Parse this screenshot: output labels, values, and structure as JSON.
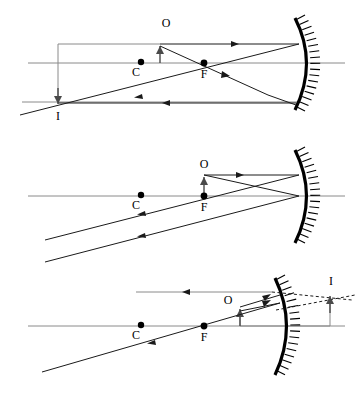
{
  "figure": {
    "background_color": "#ffffff",
    "mirror_color": "#000000",
    "ray_color": "#1a1a1a",
    "axis_color": "#8a8a8a",
    "panels": [
      {
        "id": "panel-1",
        "case": "object beyond C",
        "labels": {
          "object": "O",
          "image": "I",
          "center": "C",
          "focus": "F"
        },
        "image_type": "real inverted enlarged",
        "object_orientation": "up",
        "image_orientation": "down"
      },
      {
        "id": "panel-2",
        "case": "object at F",
        "labels": {
          "object": "O",
          "center": "C",
          "focus": "F"
        },
        "image_type": "no image, reflected rays parallel",
        "object_orientation": "up"
      },
      {
        "id": "panel-3",
        "case": "object between F and mirror",
        "labels": {
          "object": "O",
          "image": "I",
          "center": "C",
          "focus": "F"
        },
        "image_type": "virtual upright enlarged",
        "object_orientation": "up",
        "image_orientation": "up"
      }
    ]
  }
}
